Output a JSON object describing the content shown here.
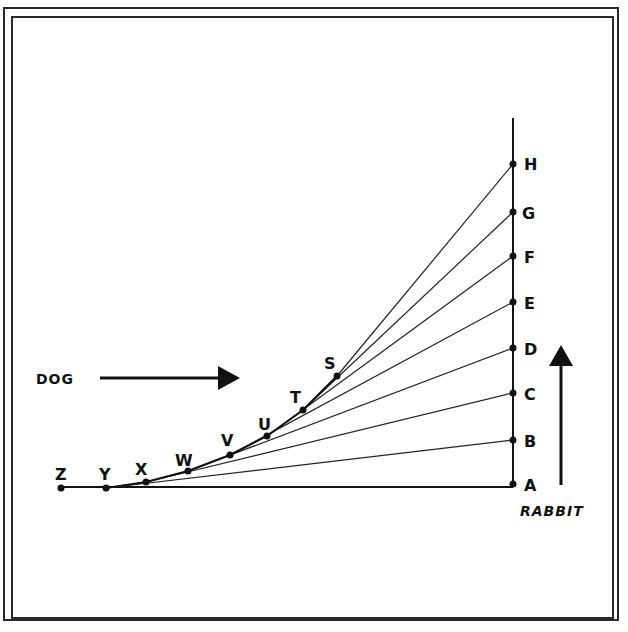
{
  "diagram": {
    "colors": {
      "ink": "#111111",
      "frame": "#2a2a2a",
      "background": "#ffffff"
    },
    "labels": {
      "dog": "DOG",
      "rabbit": "RABBIT"
    },
    "rabbit_points": [
      {
        "id": "A",
        "x": 513,
        "y": 484
      },
      {
        "id": "B",
        "x": 513,
        "y": 440
      },
      {
        "id": "C",
        "x": 513,
        "y": 393
      },
      {
        "id": "D",
        "x": 513,
        "y": 348
      },
      {
        "id": "E",
        "x": 513,
        "y": 302
      },
      {
        "id": "F",
        "x": 513,
        "y": 256
      },
      {
        "id": "G",
        "x": 513,
        "y": 212
      },
      {
        "id": "H",
        "x": 513,
        "y": 164
      }
    ],
    "dog_points": [
      {
        "id": "Z",
        "x": 61,
        "y": 488
      },
      {
        "id": "Y",
        "x": 106,
        "y": 488
      },
      {
        "id": "X",
        "x": 146,
        "y": 482
      },
      {
        "id": "W",
        "x": 188,
        "y": 471
      },
      {
        "id": "V",
        "x": 230,
        "y": 455
      },
      {
        "id": "U",
        "x": 267,
        "y": 436
      },
      {
        "id": "T",
        "x": 303,
        "y": 410
      },
      {
        "id": "S",
        "x": 337,
        "y": 376
      }
    ],
    "sight_lines": [
      {
        "from": "Y",
        "to": "A"
      },
      {
        "from": "Y",
        "to": "B"
      },
      {
        "from": "X",
        "to": "C"
      },
      {
        "from": "W",
        "to": "D"
      },
      {
        "from": "V",
        "to": "E"
      },
      {
        "from": "U",
        "to": "F"
      },
      {
        "from": "T",
        "to": "G"
      },
      {
        "from": "S",
        "to": "H"
      }
    ]
  }
}
